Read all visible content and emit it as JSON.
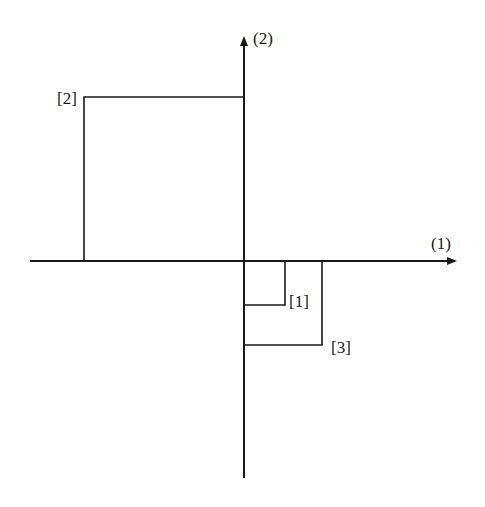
{
  "diagram": {
    "axes": {
      "horizontal_label": "(1)",
      "vertical_label": "(2)"
    },
    "points": [
      {
        "id": "1",
        "label": "[1]",
        "quadrant": "IV",
        "x": 1,
        "y": -1.1
      },
      {
        "id": "2",
        "label": "[2]",
        "quadrant": "II",
        "x": -4,
        "y": 4.1
      },
      {
        "id": "3",
        "label": "[3]",
        "quadrant": "IV",
        "x": 2,
        "y": -2.1
      }
    ],
    "colors": {
      "line": "#1a1a1a",
      "background": "#ffffff"
    }
  }
}
